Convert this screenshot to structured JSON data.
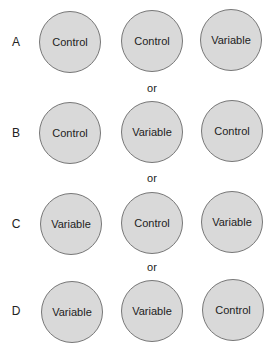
{
  "rows": [
    {
      "label": "A",
      "cells": [
        "Control",
        "Control",
        "Variable"
      ]
    },
    {
      "label": "B",
      "cells": [
        "Control",
        "Variable",
        "Control"
      ]
    },
    {
      "label": "C",
      "cells": [
        "Variable",
        "Control",
        "Variable"
      ]
    },
    {
      "label": "D",
      "cells": [
        "Variable",
        "Variable",
        "Control"
      ]
    }
  ],
  "separator": "or",
  "colors": {
    "circle_fill": "#d9d9d9",
    "circle_border": "#777777"
  }
}
